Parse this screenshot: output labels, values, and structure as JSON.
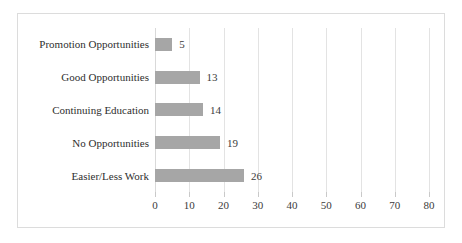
{
  "chart_data": {
    "type": "bar",
    "orientation": "horizontal",
    "title": "",
    "subtitle": "",
    "xlabel": "",
    "ylabel": "",
    "categories": [
      "Promotion Opportunities",
      "Good Opportunities",
      "Continuing Education",
      "No Opportunities",
      "Easier/Less Work"
    ],
    "values": [
      5,
      13,
      14,
      19,
      26
    ],
    "data_labels": [
      "5",
      "13",
      "14",
      "19",
      "26"
    ],
    "xlim": [
      0,
      80
    ],
    "xticks": [
      0,
      10,
      20,
      30,
      40,
      50,
      60,
      70,
      80
    ],
    "xtick_labels": [
      "0",
      "10",
      "20",
      "30",
      "40",
      "50",
      "60",
      "70",
      "80"
    ],
    "grid": true,
    "grid_axis": "x",
    "legend": false,
    "legend_position": "none",
    "bar_color": "#a6a6a6",
    "gridline_color": "#e3e3e3",
    "border_color": "#dcdcdc",
    "background_color": "#ffffff",
    "text_color": "#2e2e2e"
  }
}
